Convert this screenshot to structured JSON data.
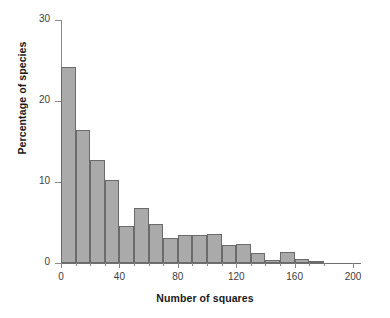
{
  "chart_data": {
    "type": "bar",
    "title": "",
    "subtitle": "",
    "xlabel": "Number of squares",
    "ylabel": "Percentage of species",
    "xlim": [
      0,
      202
    ],
    "ylim": [
      0,
      30
    ],
    "xticks": [
      0,
      40,
      80,
      120,
      160,
      200
    ],
    "xtick_labels": [
      "0",
      "40",
      "80",
      "120",
      "160",
      "200"
    ],
    "yticks": [
      0,
      10,
      20,
      30
    ],
    "ytick_labels": [
      "0",
      "10",
      "20",
      "30"
    ],
    "grid": false,
    "legend": null,
    "bar_color": "#aaaaaa",
    "bar_edge_color": "#6b6b6b",
    "bin_width": 10,
    "bin_starts": [
      0,
      10,
      20,
      30,
      40,
      50,
      60,
      70,
      80,
      90,
      100,
      110,
      120,
      130,
      140,
      150,
      160,
      170
    ],
    "categories": [
      "0-10",
      "10-20",
      "20-30",
      "30-40",
      "40-50",
      "50-60",
      "60-70",
      "70-80",
      "80-90",
      "90-100",
      "100-110",
      "110-120",
      "120-130",
      "130-140",
      "140-150",
      "150-160",
      "160-170",
      "170-180"
    ],
    "values": [
      24.2,
      16.4,
      12.7,
      10.2,
      4.6,
      6.8,
      4.8,
      3.1,
      3.4,
      3.4,
      3.6,
      2.2,
      2.4,
      1.2,
      0.4,
      1.3,
      0.5,
      0.2
    ],
    "series": [
      {
        "name": "Percentage of species",
        "values": [
          24.2,
          16.4,
          12.7,
          10.2,
          4.6,
          6.8,
          4.8,
          3.1,
          3.4,
          3.4,
          3.6,
          2.2,
          2.4,
          1.2,
          0.4,
          1.3,
          0.5,
          0.2
        ]
      }
    ]
  }
}
